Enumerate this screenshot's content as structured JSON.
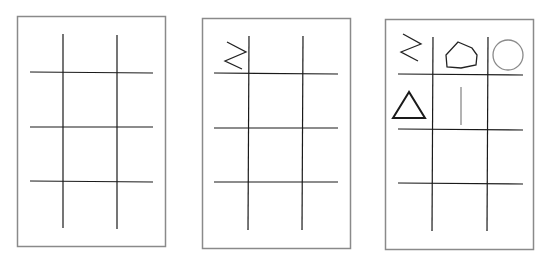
{
  "figure": {
    "colors": {
      "card_border": "#8a8a8a",
      "grid_line": "#1a1a1a",
      "symbol_dark": "#222222",
      "symbol_light": "#8a8a8a"
    },
    "panels": [
      {
        "id": "panel-1",
        "box": [
          17,
          16,
          148,
          230
        ],
        "vlines_x": [
          63,
          117
        ],
        "vline_y": [
          34,
          228
        ],
        "hlines_y": [
          72,
          127,
          181
        ],
        "hline_x": [
          30,
          152
        ],
        "symbols": []
      },
      {
        "id": "panel-2",
        "box": [
          202,
          18,
          148,
          230
        ],
        "vlines_x": [
          248,
          302
        ],
        "vline_y": [
          36,
          230
        ],
        "hlines_y": [
          74,
          128,
          182
        ],
        "hline_x": [
          214,
          338
        ],
        "symbols": [
          {
            "type": "greater-equal",
            "cell": [
              0,
              0
            ]
          }
        ]
      },
      {
        "id": "panel-3",
        "box": [
          385,
          19,
          149,
          230
        ],
        "vlines_x": [
          432,
          487
        ],
        "vline_y": [
          37,
          231
        ],
        "hlines_y": [
          75,
          129,
          183
        ],
        "hline_x": [
          398,
          522
        ],
        "symbols": [
          {
            "type": "greater-equal",
            "cell": [
              0,
              0
            ]
          },
          {
            "type": "hexagon",
            "cell": [
              0,
              1
            ]
          },
          {
            "type": "circle",
            "cell": [
              0,
              2
            ]
          },
          {
            "type": "triangle",
            "cell": [
              1,
              0
            ]
          },
          {
            "type": "vertical-bar",
            "cell": [
              1,
              1
            ]
          }
        ]
      }
    ]
  }
}
